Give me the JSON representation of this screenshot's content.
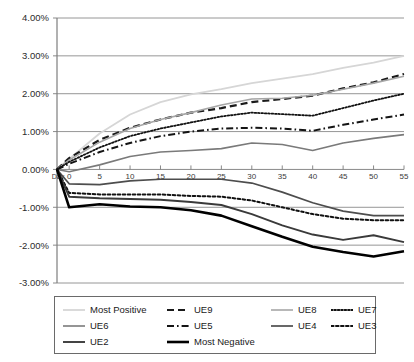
{
  "chart_data": {
    "type": "line",
    "title": "",
    "xlabel": "Day",
    "ylabel": "",
    "grid": true,
    "legend_position": "bottom",
    "ylim": [
      -0.03,
      0.04
    ],
    "ytick_labels": [
      "4.00%",
      "3.00%",
      "2.00%",
      "1.00%",
      "0.00%",
      "-1.00%",
      "-2.00%",
      "-3.00%"
    ],
    "ytick_values": [
      4.0,
      3.0,
      2.0,
      1.0,
      0.0,
      -1.0,
      -2.0,
      -3.0
    ],
    "x_origin_label": "Day",
    "xtick_labels": [
      "0",
      "5",
      "10",
      "15",
      "20",
      "25",
      "30",
      "35",
      "40",
      "45",
      "50",
      "55"
    ],
    "x": [
      -2,
      0,
      5,
      10,
      15,
      20,
      25,
      30,
      35,
      40,
      45,
      50,
      55
    ],
    "series": [
      {
        "name": "Most Positive",
        "color": "#d6d6d6",
        "width": 1.8,
        "dash": "none",
        "values": [
          0.0,
          0.28,
          0.95,
          1.45,
          1.78,
          1.98,
          2.12,
          2.28,
          2.4,
          2.52,
          2.68,
          2.82,
          3.0
        ]
      },
      {
        "name": "UE9",
        "color": "#1a1a1a",
        "width": 2.2,
        "dash": "dashed",
        "values": [
          0.0,
          0.3,
          0.78,
          1.1,
          1.32,
          1.5,
          1.62,
          1.78,
          1.86,
          1.95,
          2.14,
          2.3,
          2.52
        ]
      },
      {
        "name": "UE8",
        "color": "#a6a6a6",
        "width": 1.6,
        "dash": "none",
        "values": [
          0.0,
          0.25,
          0.72,
          1.08,
          1.32,
          1.5,
          1.7,
          1.86,
          1.88,
          1.96,
          2.12,
          2.28,
          2.46
        ]
      },
      {
        "name": "UE7",
        "color": "#111111",
        "width": 1.8,
        "dash": "dotted-fine",
        "values": [
          0.0,
          0.2,
          0.58,
          0.88,
          1.08,
          1.24,
          1.4,
          1.5,
          1.46,
          1.42,
          1.62,
          1.82,
          2.0
        ]
      },
      {
        "name": "UE6",
        "color": "#7a7a7a",
        "width": 1.6,
        "dash": "none",
        "values": [
          0.0,
          -0.06,
          0.12,
          0.34,
          0.46,
          0.5,
          0.55,
          0.7,
          0.66,
          0.5,
          0.7,
          0.82,
          0.92
        ]
      },
      {
        "name": "UE5",
        "color": "#141414",
        "width": 2.0,
        "dash": "dashdot",
        "values": [
          0.0,
          0.15,
          0.46,
          0.7,
          0.88,
          1.0,
          1.08,
          1.1,
          1.08,
          1.02,
          1.18,
          1.32,
          1.45
        ]
      },
      {
        "name": "UE4",
        "color": "#4d4d4d",
        "width": 1.7,
        "dash": "none",
        "values": [
          0.0,
          -0.38,
          -0.4,
          -0.3,
          -0.26,
          -0.26,
          -0.26,
          -0.36,
          -0.6,
          -0.88,
          -1.1,
          -1.22,
          -1.22
        ]
      },
      {
        "name": "UE3",
        "color": "#111111",
        "width": 2.0,
        "dash": "dotted-coarse",
        "values": [
          0.0,
          -0.62,
          -0.66,
          -0.66,
          -0.66,
          -0.7,
          -0.72,
          -0.82,
          -1.0,
          -1.18,
          -1.3,
          -1.34,
          -1.34
        ]
      },
      {
        "name": "UE2",
        "color": "#3a3a3a",
        "width": 1.9,
        "dash": "none",
        "values": [
          0.0,
          -0.72,
          -0.76,
          -0.78,
          -0.8,
          -0.86,
          -0.94,
          -1.18,
          -1.48,
          -1.72,
          -1.86,
          -1.74,
          -1.92
        ]
      },
      {
        "name": "Most Negative",
        "color": "#000000",
        "width": 2.6,
        "dash": "none",
        "values": [
          0.0,
          -1.0,
          -0.92,
          -0.98,
          -1.0,
          -1.08,
          -1.22,
          -1.5,
          -1.78,
          -2.04,
          -2.18,
          -2.3,
          -2.16
        ]
      }
    ]
  },
  "legend": {
    "items": [
      {
        "label": "Most Positive",
        "series": "Most Positive"
      },
      {
        "label": "UE9",
        "series": "UE9"
      },
      {
        "label": "UE8",
        "series": "UE8"
      },
      {
        "label": "UE7",
        "series": "UE7"
      },
      {
        "label": "UE6",
        "series": "UE6"
      },
      {
        "label": "UE5",
        "series": "UE5"
      },
      {
        "label": "UE4",
        "series": "UE4"
      },
      {
        "label": "UE3",
        "series": "UE3"
      },
      {
        "label": "UE2",
        "series": "UE2"
      },
      {
        "label": "Most Negative",
        "series": "Most Negative"
      }
    ]
  },
  "colors": {
    "axis": "#7d7d7d",
    "grid": "#8a8a8a",
    "text": "#1a1a1a",
    "background": "#ffffff",
    "legend_border": "#6a6a6a"
  }
}
